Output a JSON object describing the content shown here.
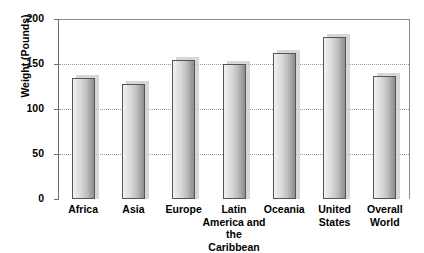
{
  "chart_data": {
    "type": "bar",
    "title": "",
    "xlabel": "",
    "ylabel": "Weight (Pounds)",
    "ylim": [
      0,
      200
    ],
    "yticks": [
      0,
      50,
      100,
      150,
      200
    ],
    "ytick_labels": [
      "0",
      "50",
      "100",
      "150",
      "200"
    ],
    "grid": true,
    "legend": false,
    "categories": [
      "Africa",
      "Asia",
      "Europe",
      "Latin\nAmerica and\nthe Caribbean",
      "Oceania",
      "United\nStates",
      "Overall\nWorld"
    ],
    "values": [
      135,
      128,
      155,
      150,
      162,
      180,
      137
    ]
  },
  "axis": {
    "y_title": "Weight (Pounds)",
    "tick_0": "0",
    "tick_50": "50",
    "tick_100": "100",
    "tick_150": "150",
    "tick_200": "200"
  },
  "categories": {
    "africa": "Africa",
    "asia": "Asia",
    "europe": "Europe",
    "latin_america": "Latin\nAmerica and\nthe Caribbean",
    "oceania": "Oceania",
    "united_states": "United\nStates",
    "overall_world": "Overall\nWorld"
  },
  "colors": {
    "bar_light": "#f2f2f2",
    "bar_dark": "#8e8e8e",
    "bar_border": "#555555",
    "gridline": "#9a9a9a",
    "frame": "#8a8a8a",
    "text": "#000000",
    "background": "#ffffff"
  }
}
